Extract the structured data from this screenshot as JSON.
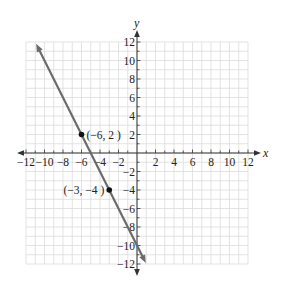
{
  "chart_data": {
    "type": "line",
    "title": "",
    "xlabel": "x",
    "ylabel": "y",
    "xlim": [
      -12,
      12
    ],
    "ylim": [
      -12,
      12
    ],
    "grid": true,
    "grid_step": 1,
    "x_ticks": [
      -12,
      -10,
      -8,
      -6,
      -4,
      -2,
      2,
      4,
      6,
      8,
      10,
      12
    ],
    "y_ticks": [
      -12,
      -10,
      -8,
      -6,
      -4,
      -2,
      2,
      4,
      6,
      8,
      10,
      12
    ],
    "x_tick_labels": [
      "−12",
      "−10",
      "−8",
      "−6",
      "−4",
      "−2",
      "2",
      "4",
      "6",
      "8",
      "10",
      "12"
    ],
    "y_tick_labels": [
      "−12",
      "−10",
      "−8",
      "−6",
      "−4",
      "−2",
      "2",
      "4",
      "6",
      "8",
      "10",
      "12"
    ],
    "series": [
      {
        "name": "line",
        "equation": "y = -2x - 10",
        "slope": -2,
        "intercept": -10,
        "x": [
          -10.9,
          0.95
        ],
        "y": [
          11.8,
          -11.9
        ],
        "arrows_both_ends": true,
        "color": "#6b6b6b"
      }
    ],
    "points": [
      {
        "x": -6,
        "y": 2,
        "label": "(−6, 2 )"
      },
      {
        "x": -3,
        "y": -4,
        "label": "(−3, −4 )"
      }
    ],
    "legend": null
  },
  "colors": {
    "grid": "#dcdcdc",
    "axis": "#333333",
    "line": "#6b6b6b",
    "point": "#111111"
  }
}
